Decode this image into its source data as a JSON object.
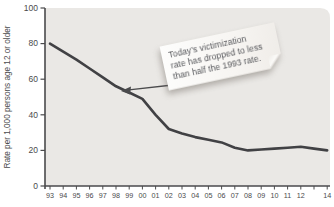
{
  "figure": {
    "y_axis_title": "Rate per 1,000 persons age 12 or older",
    "note": {
      "line1": "Today’s victimization",
      "line2": "rate has dropped to less",
      "line3": "than half the 1993 rate."
    }
  },
  "chart_data": {
    "type": "line",
    "title": "",
    "xlabel": "",
    "ylabel": "Rate per 1,000 persons age 12 or older",
    "x": [
      1993,
      1994,
      1995,
      1996,
      1997,
      1998,
      1999,
      2000,
      2001,
      2002,
      2003,
      2004,
      2005,
      2006,
      2007,
      2008,
      2009,
      2010,
      2011,
      2012,
      2013,
      2014
    ],
    "x_tick_labels": [
      "93",
      "94",
      "95",
      "96",
      "97",
      "98",
      "99",
      "00",
      "01",
      "02",
      "03",
      "04",
      "05",
      "06",
      "07",
      "08",
      "09",
      "10",
      "11",
      "12",
      "",
      "14"
    ],
    "values": [
      80,
      75.5,
      71,
      66,
      61,
      56,
      52.5,
      49,
      40,
      32,
      29.5,
      27.5,
      26,
      24.5,
      21.5,
      20,
      20.5,
      21,
      21.5,
      22,
      21,
      20
    ],
    "y_ticks": [
      0,
      20,
      40,
      60,
      80,
      100
    ],
    "ylim": [
      0,
      100
    ],
    "grid": false,
    "legend": "none",
    "annotation": "Today’s victimization rate has dropped to less than half the 1993 rate.",
    "annotation_arrow_points_to": {
      "year": 1998.5,
      "value": 54
    },
    "colors": {
      "plot_bg": "#eae8e5",
      "line": "#414144",
      "axis": "#4a4a4c",
      "tick_text": "#4a4a4c",
      "note_bg": "#fbfaf7",
      "note_text": "#55565a"
    }
  }
}
